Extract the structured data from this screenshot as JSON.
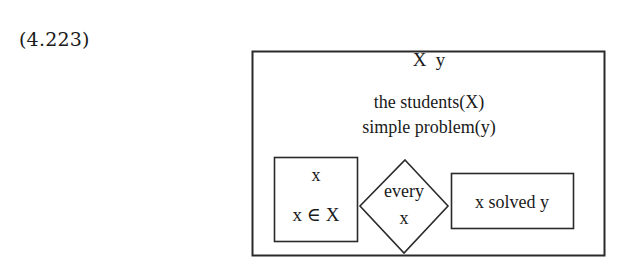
{
  "equation_label": "(4.223)",
  "drs": {
    "universe": "X  y",
    "conditions": [
      "the students(X)",
      "simple problem(y)"
    ],
    "duplex": {
      "restrictor": {
        "universe": "x",
        "condition": "x ∈ X"
      },
      "quantifier": {
        "word": "every",
        "variable": "x"
      },
      "scope": {
        "condition": "x solved y"
      }
    }
  },
  "colors": {
    "line": "#2a2a2a",
    "text": "#1a1a1a",
    "background": "#ffffff"
  }
}
